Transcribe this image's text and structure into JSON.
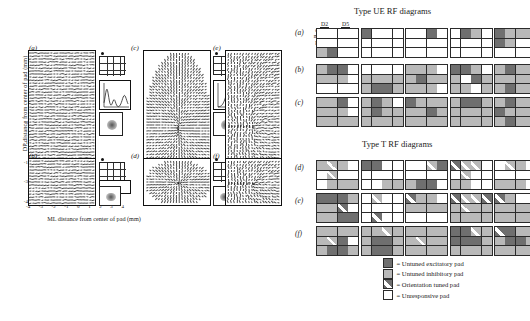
{
  "left_panels": {
    "ylabel": "DP distance from center of pad (mm)",
    "xlabel": "ML distance from center of pad (mm)",
    "xticks": [
      "-4",
      "-3",
      "-2",
      "-1",
      "0",
      "1",
      "2",
      "3",
      "4"
    ],
    "yticks": [
      "4",
      "3",
      "2",
      "1",
      "0",
      "-1",
      "-2",
      "-3",
      "-4"
    ],
    "panels": [
      {
        "id": "a",
        "label": "(a)"
      },
      {
        "id": "b",
        "label": "(b)"
      },
      {
        "id": "c",
        "label": "(c)"
      },
      {
        "id": "d",
        "label": "(d)"
      },
      {
        "id": "e",
        "label": "(e)"
      },
      {
        "id": "f",
        "label": "(f)"
      }
    ]
  },
  "rf_sections": [
    {
      "title": "Type UE RF diagrams",
      "col_header_left": "D2",
      "col_header_right": "D5",
      "row_header_letters": [
        "d",
        "m",
        "p"
      ],
      "rows": [
        {
          "label": "(a)",
          "grids": [
            [
              "un",
              "un",
              "un",
              "un",
              "un",
              "un",
              "un",
              "un",
              "ui",
              "ue",
              "un",
              "un"
            ],
            [
              "ue",
              "un",
              "un",
              "un",
              "un",
              "un",
              "un",
              "un",
              "un",
              "un",
              "un",
              "un"
            ],
            [
              "un",
              "un",
              "ue",
              "un",
              "un",
              "un",
              "un",
              "un",
              "un",
              "un",
              "un",
              "un"
            ],
            [
              "un",
              "ue",
              "ui",
              "un",
              "un",
              "un",
              "un",
              "un",
              "un",
              "un",
              "un",
              "un"
            ],
            [
              "ue",
              "ui",
              "ui",
              "ui",
              "ue",
              "ui",
              "un",
              "un",
              "un",
              "un",
              "un",
              "un"
            ]
          ]
        },
        {
          "label": "(b)",
          "grids": [
            [
              "ui",
              "ue",
              "ue",
              "un",
              "ui",
              "ui",
              "ui",
              "un",
              "un",
              "un",
              "un",
              "un"
            ],
            [
              "un",
              "un",
              "un",
              "un",
              "ui",
              "ui",
              "ui",
              "ui",
              "ui",
              "ue",
              "ue",
              "ui"
            ],
            [
              "ui",
              "ui",
              "ui",
              "un",
              "ui",
              "ue",
              "ui",
              "ui",
              "ui",
              "ui",
              "ui",
              "un"
            ],
            [
              "ue",
              "ue",
              "ui",
              "un",
              "ui",
              "un",
              "ue",
              "ui",
              "ui",
              "ui",
              "un",
              "ui"
            ],
            [
              "ui",
              "ue",
              "ui",
              "ui",
              "ui",
              "ui",
              "ui",
              "ui",
              "ui",
              "ue",
              "ui",
              "ui"
            ]
          ]
        },
        {
          "label": "(c)",
          "grids": [
            [
              "ui",
              "ui",
              "ue",
              "un",
              "ui",
              "ui",
              "ui",
              "un",
              "ui",
              "ui",
              "ui",
              "ui"
            ],
            [
              "ui",
              "ue",
              "ui",
              "un",
              "ui",
              "ue",
              "ui",
              "ui",
              "ui",
              "ui",
              "ui",
              "ui"
            ],
            [
              "ue",
              "ui",
              "ui",
              "ui",
              "ui",
              "ui",
              "ue",
              "ui",
              "ui",
              "ui",
              "ui",
              "ui"
            ],
            [
              "ui",
              "ue",
              "ue",
              "ui",
              "ui",
              "ui",
              "ui",
              "ui",
              "ui",
              "ui",
              "ui",
              "ui"
            ],
            [
              "ui",
              "ue",
              "ui",
              "ui",
              "ue",
              "ui",
              "ui",
              "ui",
              "ui",
              "ue",
              "ui",
              "ui"
            ]
          ]
        }
      ]
    },
    {
      "title": "Type T RF diagrams",
      "rows": [
        {
          "label": "(d)",
          "grids": [
            [
              "ui",
              "ot",
              "ui",
              "un",
              "un",
              "ot",
              "un",
              "un",
              "un",
              "ui",
              "ui",
              "ui"
            ],
            [
              "ue",
              "ue",
              "un",
              "un",
              "un",
              "un",
              "un",
              "un",
              "un",
              "un",
              "ui",
              "ui"
            ],
            [
              "un",
              "un",
              "ot",
              "ue",
              "un",
              "un",
              "un",
              "un",
              "ui",
              "ue",
              "ue",
              "un"
            ],
            [
              "ot",
              "ot",
              "ot",
              "un",
              "un",
              "ot",
              "un",
              "un",
              "ui",
              "ui",
              "un",
              "un"
            ],
            [
              "un",
              "ot",
              "ui",
              "un",
              "un",
              "un",
              "un",
              "un",
              "ui",
              "ui",
              "ui",
              "un"
            ]
          ]
        },
        {
          "label": "(e)",
          "grids": [
            [
              "ue",
              "ue",
              "ue",
              "ui",
              "ui",
              "ui",
              "ot",
              "un",
              "ui",
              "ui",
              "ue",
              "ue"
            ],
            [
              "un",
              "ot",
              "un",
              "un",
              "un",
              "un",
              "un",
              "un",
              "un",
              "ot",
              "un",
              "un"
            ],
            [
              "ot",
              "ui",
              "ui",
              "un",
              "ui",
              "ui",
              "ui",
              "ui",
              "un",
              "un",
              "un",
              "un"
            ],
            [
              "ot",
              "ot",
              "ot",
              "ot",
              "ui",
              "ot",
              "ui",
              "ui",
              "ui",
              "ui",
              "ui",
              "ui"
            ],
            [
              "ot",
              "ui",
              "un",
              "un",
              "ui",
              "ui",
              "ui",
              "ui",
              "ui",
              "ui",
              "ui",
              "ui"
            ]
          ]
        },
        {
          "label": "(f)",
          "grids": [
            [
              "ui",
              "ui",
              "ui",
              "ui",
              "ui",
              "ot",
              "ue",
              "un",
              "ui",
              "ue",
              "ue",
              "ui"
            ],
            [
              "ui",
              "ui",
              "ot",
              "ui",
              "ui",
              "ue",
              "ue",
              "ui",
              "ui",
              "ue",
              "ue",
              "ui"
            ],
            [
              "ui",
              "ui",
              "ui",
              "ui",
              "ui",
              "ot",
              "ui",
              "ui",
              "ui",
              "ui",
              "ui",
              "ui"
            ],
            [
              "ue",
              "ue",
              "ot",
              "ui",
              "ue",
              "ue",
              "ue",
              "ui",
              "ui",
              "ui",
              "ui",
              "ui"
            ],
            [
              "ot",
              "ue",
              "ui",
              "ui",
              "ui",
              "ue",
              "ue",
              "ui",
              "ui",
              "ui",
              "ui",
              "ui"
            ]
          ]
        }
      ]
    }
  ],
  "legend": {
    "items": [
      {
        "swatch": "ue",
        "text": "= Untuned excitatory pad"
      },
      {
        "swatch": "ui",
        "text": "= Untuned inhibitory pad"
      },
      {
        "swatch": "ot",
        "text": "= Orientation tuned pad"
      },
      {
        "swatch": "un",
        "text": "= Unresponsive pad"
      }
    ]
  },
  "colors": {
    "untuned_excitatory": "#6f6f6f",
    "untuned_inhibitory": "#b9b9b9",
    "unresponsive": "#ffffff",
    "grid_line": "#2b2b2b"
  }
}
